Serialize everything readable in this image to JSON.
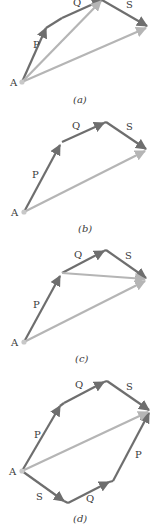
{
  "colors": {
    "vector_dark": "#6e6e6e",
    "vector_light": "#b5b5b5",
    "label": "#3a3a3a",
    "point": "#c8c8c8"
  },
  "panels": [
    {
      "caption": "(a)",
      "point_label": "A",
      "vectors": [
        "P",
        "Q",
        "S"
      ],
      "resultants": [
        "P + Q",
        "P + Q + S"
      ]
    },
    {
      "caption": "(b)",
      "point_label": "A",
      "vectors": [
        "P",
        "Q",
        "S"
      ],
      "resultants": [
        "P + Q + S"
      ]
    },
    {
      "caption": "(c)",
      "point_label": "A",
      "vectors": [
        "P",
        "Q",
        "S"
      ],
      "resultants": [
        "Q + S",
        "P + Q + S"
      ]
    },
    {
      "caption": "(d)",
      "point_label": "A",
      "vectors": [
        "P",
        "Q",
        "S"
      ],
      "lower_vectors": [
        "S",
        "Q",
        "P"
      ],
      "resultants": [
        "P + Q + S",
        "= S + Q + P"
      ]
    }
  ]
}
